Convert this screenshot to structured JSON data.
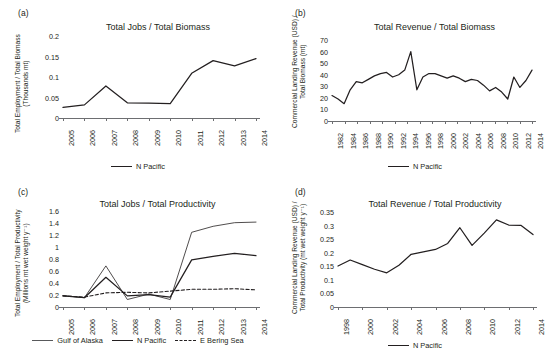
{
  "figure": {
    "panels": [
      "a",
      "b",
      "c",
      "d"
    ]
  },
  "panel_a": {
    "letter": "(a)",
    "title": "Total Jobs / Total Biomass",
    "ylabel_line1": "Total Employment / Total Biomass",
    "ylabel_line2": "(Thousands mt)",
    "legend": [
      {
        "label": "N Pacific",
        "style": "solid-thick"
      }
    ]
  },
  "panel_b": {
    "letter": "(b)",
    "title": "Total Revenue / Total Biomass",
    "ylabel_line1": "Commercial Landing Revenue (USD) /",
    "ylabel_line2": "Total Biomass (mt)",
    "legend": [
      {
        "label": "N Pacific",
        "style": "solid-thick"
      }
    ]
  },
  "panel_c": {
    "letter": "(c)",
    "title": "Total Jobs / Total Productivity",
    "ylabel_line1": "Total Employment / Total Productivity",
    "ylabel_line2": "(Millions mt wet weight y⁻¹)",
    "legend": [
      {
        "label": "Gulf of Alaska",
        "style": "solid-thin"
      },
      {
        "label": "N Pacific",
        "style": "solid-thick"
      },
      {
        "label": "E Bering Sea",
        "style": "dashed"
      }
    ]
  },
  "panel_d": {
    "letter": "(d)",
    "title": "Total Revenue / Total Productivity",
    "ylabel_line1": "Commercial Landing Revenue (USD) /",
    "ylabel_line2": "Total Productivity (mt wet weight y⁻¹)",
    "legend": [
      {
        "label": "N Pacific",
        "style": "solid-thick"
      }
    ]
  },
  "chart_data": [
    {
      "panel": "a",
      "type": "line",
      "title": "Total Jobs / Total Biomass",
      "xlabel": "",
      "ylabel": "Total Employment / Total Biomass (Thousands mt)",
      "x": [
        2005,
        2006,
        2007,
        2008,
        2009,
        2010,
        2011,
        2012,
        2013,
        2014
      ],
      "xtick_labels": [
        "2005",
        "2006",
        "2007",
        "2008",
        "2009",
        "2010",
        "2011",
        "2012",
        "2013",
        "2014"
      ],
      "ytick_labels": [
        "0",
        "0.05",
        "0.1",
        "0.15",
        "0.2"
      ],
      "ytick_values": [
        0,
        0.05,
        0.1,
        0.15,
        0.2
      ],
      "ylim": [
        0,
        0.2
      ],
      "grid": false,
      "legend_position": "bottom",
      "series": [
        {
          "name": "N Pacific",
          "style": "solid-thick",
          "values": [
            0.026,
            0.032,
            0.078,
            0.037,
            0.036,
            0.035,
            0.109,
            0.14,
            0.127,
            0.145
          ]
        }
      ]
    },
    {
      "panel": "b",
      "type": "line",
      "title": "Total Revenue / Total Biomass",
      "xlabel": "",
      "ylabel": "Commercial Landing Revenue (USD) / Total Biomass (mt)",
      "x": [
        1982,
        1983,
        1984,
        1985,
        1986,
        1987,
        1988,
        1989,
        1990,
        1991,
        1992,
        1993,
        1994,
        1995,
        1996,
        1997,
        1998,
        1999,
        2000,
        2001,
        2002,
        2003,
        2004,
        2005,
        2006,
        2007,
        2008,
        2009,
        2010,
        2011,
        2012,
        2013,
        2014,
        2015
      ],
      "xtick_labels": [
        "1982",
        "1984",
        "1986",
        "1988",
        "1990",
        "1992",
        "1994",
        "1996",
        "1998",
        "2000",
        "2002",
        "2004",
        "2006",
        "2008",
        "2010",
        "2012",
        "2014"
      ],
      "ytick_labels": [
        "0",
        "10",
        "20",
        "30",
        "40",
        "50",
        "60",
        "70"
      ],
      "ytick_values": [
        0,
        10,
        20,
        30,
        40,
        50,
        60,
        70
      ],
      "ylim": [
        0,
        70
      ],
      "grid": false,
      "legend_position": "bottom",
      "series": [
        {
          "name": "N Pacific",
          "style": "solid-thick",
          "values": [
            22,
            19,
            15,
            27,
            34,
            33,
            36,
            39,
            41,
            42,
            38,
            40,
            44,
            60,
            27,
            38,
            41,
            41,
            39,
            37,
            39,
            37,
            34,
            36,
            35,
            31,
            26,
            29,
            25,
            19,
            38,
            29,
            35,
            44
          ]
        }
      ]
    },
    {
      "panel": "c",
      "type": "line",
      "title": "Total Jobs / Total Productivity",
      "xlabel": "",
      "ylabel": "Total Employment / Total Productivity (Millions mt wet weight y⁻¹)",
      "x": [
        2005,
        2006,
        2007,
        2008,
        2009,
        2010,
        2011,
        2012,
        2013,
        2014
      ],
      "xtick_labels": [
        "2005",
        "2006",
        "2007",
        "2008",
        "2009",
        "2010",
        "2011",
        "2012",
        "2013",
        "2014"
      ],
      "ytick_labels": [
        "0",
        "0.2",
        "0.4",
        "0.6",
        "0.8",
        "1",
        "1.2",
        "1.4",
        "1.6"
      ],
      "ytick_values": [
        0,
        0.2,
        0.4,
        0.6,
        0.8,
        1.0,
        1.2,
        1.4,
        1.6
      ],
      "ylim": [
        0,
        1.6
      ],
      "grid": false,
      "legend_position": "bottom",
      "series": [
        {
          "name": "Gulf of Alaska",
          "style": "solid-thin",
          "values": [
            0.19,
            0.155,
            0.685,
            0.125,
            0.215,
            0.125,
            1.245,
            1.345,
            1.405,
            1.415
          ]
        },
        {
          "name": "N Pacific",
          "style": "solid-thick",
          "values": [
            0.185,
            0.155,
            0.495,
            0.185,
            0.205,
            0.165,
            0.785,
            0.845,
            0.895,
            0.855
          ]
        },
        {
          "name": "E Bering Sea",
          "style": "dashed",
          "values": [
            0.185,
            0.165,
            0.235,
            0.245,
            0.235,
            0.265,
            0.295,
            0.295,
            0.305,
            0.285
          ]
        }
      ]
    },
    {
      "panel": "d",
      "type": "line",
      "title": "Total Revenue / Total Productivity",
      "xlabel": "",
      "ylabel": "Commercial Landing Revenue (USD) / Total Productivity (mt wet weight y⁻¹)",
      "x": [
        1998,
        1999,
        2000,
        2001,
        2002,
        2003,
        2004,
        2005,
        2006,
        2007,
        2008,
        2009,
        2010,
        2011,
        2012,
        2013,
        2014
      ],
      "xtick_labels": [
        "1998",
        "2000",
        "2002",
        "2004",
        "2006",
        "2008",
        "2010",
        "2012",
        "2014"
      ],
      "ytick_labels": [
        "0",
        "0.05",
        "0.1",
        "0.15",
        "0.2",
        "0.25",
        "0.3",
        "0.35"
      ],
      "ytick_values": [
        0,
        0.05,
        0.1,
        0.15,
        0.2,
        0.25,
        0.3,
        0.35
      ],
      "ylim": [
        0,
        0.35
      ],
      "grid": false,
      "legend_position": "bottom",
      "series": [
        {
          "name": "N Pacific",
          "style": "solid-thick",
          "values": [
            0.151,
            0.173,
            0.156,
            0.139,
            0.126,
            0.154,
            0.194,
            0.203,
            0.212,
            0.234,
            0.292,
            0.227,
            0.272,
            0.321,
            0.302,
            0.301,
            0.267
          ]
        }
      ]
    }
  ]
}
